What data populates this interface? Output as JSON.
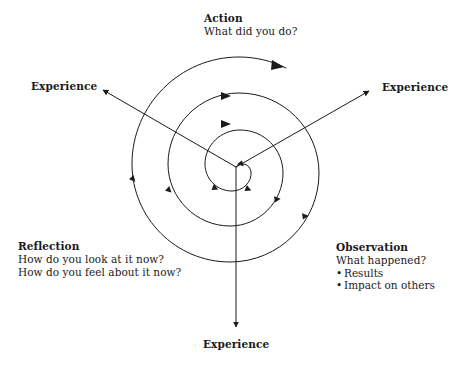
{
  "diagram": {
    "background_color": "#ffffff",
    "stroke_color": "#1a1a1a",
    "blocks": {
      "action": {
        "heading": "Action",
        "lines": [
          "What did you do?"
        ]
      },
      "reflection": {
        "heading": "Reflection",
        "lines": [
          "How do you look at it now?",
          "How do you feel about it now?"
        ]
      },
      "observation": {
        "heading": "Observation",
        "lines": [
          "What happened?"
        ],
        "bullets": [
          "Results",
          "Impact on others"
        ]
      }
    },
    "axes": {
      "left_label": "Experience",
      "right_label": "Experience",
      "bottom_label": "Experience"
    }
  }
}
